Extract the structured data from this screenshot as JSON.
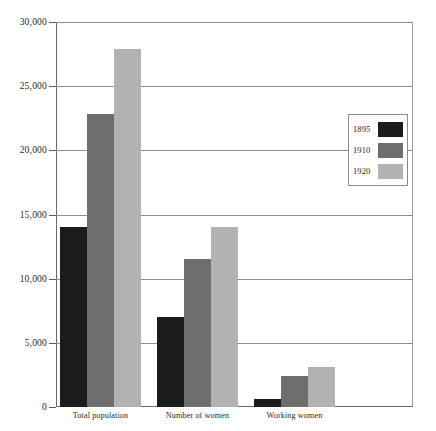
{
  "chart_data": {
    "type": "bar",
    "title": "",
    "subtitle": "",
    "xlabel": "",
    "ylabel": "",
    "categories": [
      "Total population",
      "Number of women",
      "Working women"
    ],
    "series": [
      {
        "name": "1895",
        "color": "#1c1c1c",
        "values": [
          14000,
          7000,
          600
        ]
      },
      {
        "name": "1910",
        "color": "#6e6e6e",
        "values": [
          22800,
          11500,
          2400
        ]
      },
      {
        "name": "1920",
        "color": "#b2b2b2",
        "values": [
          27900,
          14000,
          3100
        ]
      }
    ],
    "ylim": [
      0,
      30000
    ],
    "ytick_values": [
      0,
      5000,
      10000,
      15000,
      20000,
      25000,
      30000
    ],
    "ytick_labels": [
      "0",
      "5,000",
      "10,000",
      "15,000",
      "20,000",
      "25,000",
      "30,000"
    ],
    "grid": true,
    "legend_position": "right",
    "annotations": []
  },
  "colors": {
    "axis": "#6a6a6a",
    "gridline": "#8d8d8d",
    "legend_border": "#8a8a8a",
    "background": "#ffffff",
    "text": "#1f1f1f"
  }
}
